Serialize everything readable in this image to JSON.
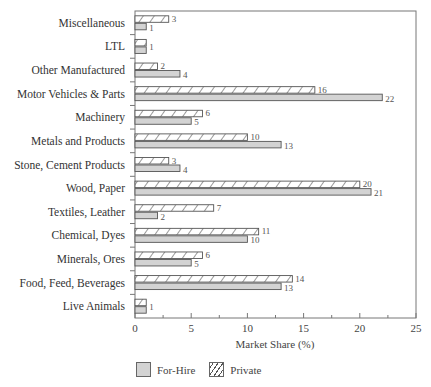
{
  "chart_data": {
    "type": "bar",
    "orientation": "horizontal",
    "title": "",
    "xlabel": "Market Share (%)",
    "ylabel": "",
    "xlim": [
      0,
      25
    ],
    "xticks": [
      0,
      5,
      10,
      15,
      20,
      25
    ],
    "grid": false,
    "legend_position": "bottom",
    "categories": [
      "Miscellaneous",
      "LTL",
      "Other Manufactured",
      "Motor Vehicles & Parts",
      "Machinery",
      "Metals and Products",
      "Stone, Cement Products",
      "Wood, Paper",
      "Textiles, Leather",
      "Chemical, Dyes",
      "Minerals, Ores",
      "Food, Feed, Beverages",
      "Live Animals"
    ],
    "series": [
      {
        "name": "Private",
        "pattern": "hatched",
        "values": [
          3,
          1,
          2,
          16,
          6,
          10,
          3,
          20,
          7,
          11,
          6,
          14,
          1
        ]
      },
      {
        "name": "For-Hire",
        "pattern": "solid",
        "color": "#d3d3d3",
        "values": [
          1,
          1,
          4,
          22,
          5,
          13,
          4,
          21,
          2,
          10,
          5,
          13,
          1
        ]
      }
    ]
  },
  "legend": {
    "items": [
      {
        "label": "For-Hire",
        "pattern": "solid"
      },
      {
        "label": "Private",
        "pattern": "hatched"
      }
    ]
  },
  "colors": {
    "for_hire_fill": "#d3d3d3",
    "bar_stroke": "#555555",
    "axis": "#666666"
  }
}
